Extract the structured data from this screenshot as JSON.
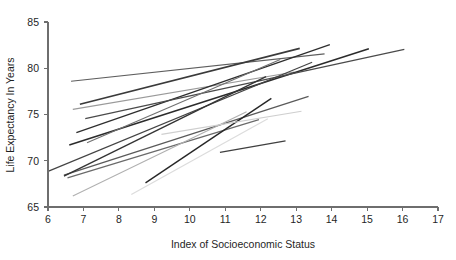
{
  "chart_data": {
    "type": "line",
    "title": "",
    "xlabel": "Index of Socioeconomic Status",
    "ylabel": "Life Expectancy In Years",
    "xlim": [
      6,
      17
    ],
    "ylim": [
      65,
      85
    ],
    "xticks": [
      6,
      7,
      8,
      9,
      10,
      11,
      12,
      13,
      14,
      15,
      16,
      17
    ],
    "yticks": [
      65,
      70,
      75,
      80,
      85
    ],
    "xtick_labels": [
      "6",
      "7",
      "8",
      "9",
      "10",
      "11",
      "12",
      "13",
      "14",
      "15",
      "16",
      "17"
    ],
    "ytick_labels": [
      "65",
      "70",
      "75",
      "80",
      "85"
    ],
    "grid": false,
    "legend": "none",
    "series": [
      {
        "name": "line-1",
        "x": [
          6.65,
          13.8
        ],
        "y": [
          78.6,
          81.55
        ],
        "color": "#5e5e5e",
        "width": 1.1
      },
      {
        "name": "line-2",
        "x": [
          6.7,
          12.95
        ],
        "y": [
          75.55,
          79.6
        ],
        "color": "#9a9a9a",
        "width": 1.1
      },
      {
        "name": "line-3",
        "x": [
          6.9,
          13.1
        ],
        "y": [
          76.1,
          82.15
        ],
        "color": "#3a3a3a",
        "width": 1.6
      },
      {
        "name": "line-4",
        "x": [
          6.8,
          13.95
        ],
        "y": [
          73.05,
          82.55
        ],
        "color": "#2e2e2e",
        "width": 1.3
      },
      {
        "name": "line-5",
        "x": [
          6.6,
          15.05
        ],
        "y": [
          71.7,
          82.1
        ],
        "color": "#2b2b2b",
        "width": 1.5
      },
      {
        "name": "line-6",
        "x": [
          7.05,
          16.05
        ],
        "y": [
          74.55,
          82.05
        ],
        "color": "#4a4a4a",
        "width": 1.2
      },
      {
        "name": "line-7",
        "x": [
          7.1,
          12.55
        ],
        "y": [
          71.95,
          80.95
        ],
        "color": "#707070",
        "width": 1.1
      },
      {
        "name": "line-8",
        "x": [
          6.0,
          13.45
        ],
        "y": [
          68.85,
          80.65
        ],
        "color": "#444444",
        "width": 1.2
      },
      {
        "name": "line-9",
        "x": [
          6.45,
          13.35
        ],
        "y": [
          68.45,
          76.95
        ],
        "color": "#5a5a5a",
        "width": 1.3
      },
      {
        "name": "line-10",
        "x": [
          6.45,
          12.15
        ],
        "y": [
          68.35,
          79.1
        ],
        "color": "#343434",
        "width": 1.4
      },
      {
        "name": "line-11",
        "x": [
          6.55,
          11.95
        ],
        "y": [
          68.15,
          74.45
        ],
        "color": "#6a6a6a",
        "width": 1.2
      },
      {
        "name": "line-12",
        "x": [
          6.7,
          11.6
        ],
        "y": [
          66.2,
          75.3
        ],
        "color": "#b0b0b0",
        "width": 1.1
      },
      {
        "name": "line-13",
        "x": [
          8.35,
          12.2
        ],
        "y": [
          66.35,
          74.55
        ],
        "color": "#dcdcdc",
        "width": 1.2
      },
      {
        "name": "line-14",
        "x": [
          8.75,
          12.3
        ],
        "y": [
          67.6,
          76.75
        ],
        "color": "#272727",
        "width": 1.4
      },
      {
        "name": "line-15",
        "x": [
          9.2,
          13.15
        ],
        "y": [
          72.85,
          75.35
        ],
        "color": "#cfcfcf",
        "width": 1.1
      },
      {
        "name": "line-16",
        "x": [
          10.85,
          12.7
        ],
        "y": [
          70.9,
          72.15
        ],
        "color": "#3f3f3f",
        "width": 1.3
      }
    ]
  },
  "caption": {
    "partial_text": ""
  }
}
